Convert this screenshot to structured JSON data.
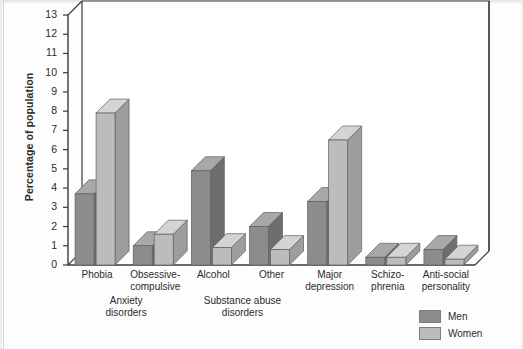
{
  "chart_data": {
    "type": "bar",
    "title": "",
    "xlabel": "",
    "ylabel": "Percentage of population",
    "ylim": [
      0,
      13
    ],
    "ytick_labels": [
      "13",
      "12",
      "11",
      "10",
      "9",
      "8",
      "7",
      "6",
      "5",
      "4",
      "3",
      "2",
      "1",
      "0"
    ],
    "grid": false,
    "legend_position": "bottom-right",
    "categories": [
      "Phobia",
      "Obsessive-\ncompulsive",
      "Alcohol",
      "Other",
      "Major\ndepression",
      "Schizo-\nphrenia",
      "Anti-social\npersonality"
    ],
    "groups": [
      {
        "label": "Anxiety\ndisorders",
        "categories": [
          "Phobia",
          "Obsessive-compulsive"
        ]
      },
      {
        "label": "Substance abuse\ndisorders",
        "categories": [
          "Alcohol",
          "Other"
        ]
      }
    ],
    "series": [
      {
        "name": "Men",
        "color": "#8c8c8c",
        "values": [
          3.7,
          1.0,
          4.9,
          2.0,
          3.3,
          0.4,
          0.8
        ]
      },
      {
        "name": "Women",
        "color": "#bcbcbc",
        "values": [
          7.9,
          1.6,
          0.9,
          0.8,
          6.5,
          0.4,
          0.3
        ]
      }
    ]
  },
  "axis": {
    "ylabel": "Percentage of population",
    "ticks": [
      "13",
      "12",
      "11",
      "10",
      "9",
      "8",
      "7",
      "6",
      "5",
      "4",
      "3",
      "2",
      "1",
      "0"
    ]
  },
  "categories": [
    {
      "label": "Phobia"
    },
    {
      "label": "Obsessive-\ncompulsive"
    },
    {
      "label": "Alcohol"
    },
    {
      "label": "Other"
    },
    {
      "label": "Major\ndepression"
    },
    {
      "label": "Schizo-\nphrenia"
    },
    {
      "label": "Anti-social\npersonality"
    }
  ],
  "group_labels": [
    {
      "label": "Anxiety\ndisorders"
    },
    {
      "label": "Substance abuse\ndisorders"
    }
  ],
  "legend": {
    "items": [
      {
        "label": "Men",
        "color": "#8c8c8c"
      },
      {
        "label": "Women",
        "color": "#bcbcbc"
      }
    ]
  },
  "colors": {
    "men": "#8c8c8c",
    "women": "#bcbcbc",
    "men_top": "#a8a8a8",
    "men_side": "#6e6e6e",
    "women_top": "#d4d4d4",
    "women_side": "#9d9d9d",
    "axis": "#3a3a3a",
    "background": "#fdfdfd"
  }
}
